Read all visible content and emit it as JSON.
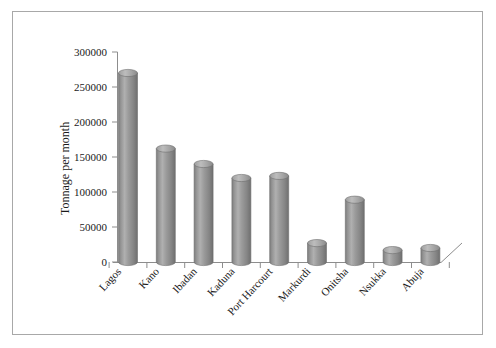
{
  "chart_data": {
    "type": "bar",
    "title": "",
    "xlabel": "",
    "ylabel": "Tonnage per month",
    "categories": [
      "Lagos",
      "Kano",
      "Ibadan",
      "Kaduna",
      "Port Harcourt",
      "Markurdi",
      "Onitsha",
      "Nsukka",
      "Abuja"
    ],
    "values": [
      270000,
      162000,
      140000,
      120000,
      123000,
      27000,
      89000,
      17000,
      20000
    ],
    "ylim": [
      0,
      300000
    ],
    "ytick_labels": [
      "0",
      "50000",
      "100000",
      "150000",
      "200000",
      "250000",
      "300000"
    ],
    "ytick_values": [
      0,
      50000,
      100000,
      150000,
      200000,
      250000,
      300000
    ],
    "grid": false,
    "legend": "none",
    "style": "3d-cylinder",
    "bar_color": "#8f8f8f",
    "bar_color_light": "#b5b5b5",
    "bar_color_dark": "#6e6e6e",
    "axis_color": "#8d8d8d",
    "frame_color": "#a8a8a8",
    "background": "#ffffff"
  }
}
